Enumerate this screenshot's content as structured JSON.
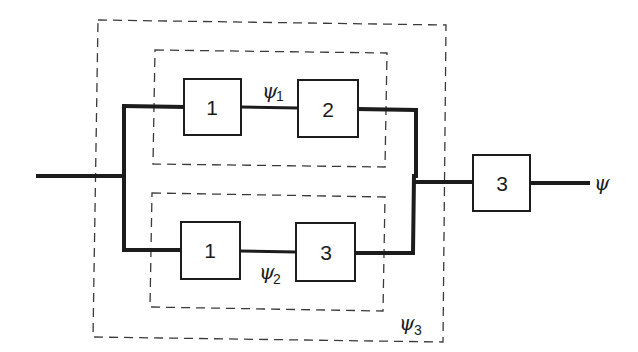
{
  "diagram": {
    "type": "reliability-block-diagram",
    "blocks": [
      {
        "id": "top-1",
        "label": "1",
        "branch": "upper"
      },
      {
        "id": "top-2",
        "label": "2",
        "branch": "upper"
      },
      {
        "id": "bot-1",
        "label": "1",
        "branch": "lower"
      },
      {
        "id": "bot-3",
        "label": "3",
        "branch": "lower"
      },
      {
        "id": "series-3",
        "label": "3",
        "branch": "series"
      }
    ],
    "groups": [
      {
        "id": "psi1",
        "symbol": "ψ",
        "subscript": "1",
        "encloses": [
          "top-1",
          "top-2"
        ]
      },
      {
        "id": "psi2",
        "symbol": "ψ",
        "subscript": "2",
        "encloses": [
          "bot-1",
          "bot-3"
        ]
      },
      {
        "id": "psi3",
        "symbol": "ψ",
        "subscript": "3",
        "encloses": [
          "psi1",
          "psi2"
        ]
      }
    ],
    "output": {
      "symbol": "ψ"
    }
  }
}
